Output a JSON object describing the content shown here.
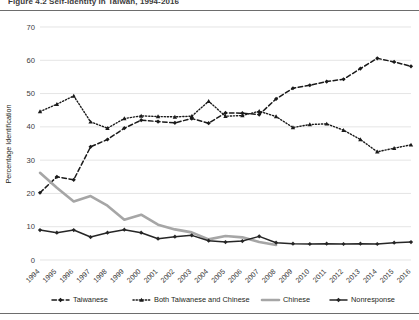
{
  "figure": {
    "title": "Figure 4.2   Self-identity in Taiwan, 1994-2016",
    "title_clipped": true
  },
  "chart_data": {
    "type": "line",
    "title": "Figure 4.2   Self-identity in Taiwan, 1994-2016",
    "xlabel": "",
    "ylabel": "Percentage Identification",
    "ylim": [
      0,
      70
    ],
    "ytick_step": 10,
    "yticks": [
      0,
      10,
      20,
      30,
      40,
      50,
      60,
      70
    ],
    "grid": true,
    "legend_position": "bottom",
    "categories": [
      "1994",
      "1995",
      "1996",
      "1997",
      "1998",
      "1999",
      "2000",
      "2001",
      "2002",
      "2003",
      "2004",
      "2005",
      "2006",
      "2007",
      "2008",
      "2009",
      "2010",
      "2011",
      "2012",
      "2013",
      "2014",
      "2015",
      "2016"
    ],
    "series": [
      {
        "name": "Taiwanese",
        "style": "dashed",
        "color": "#1a1a1a",
        "marker": "diamond",
        "values": [
          20.2,
          25.0,
          24.1,
          34.0,
          36.2,
          39.6,
          42.0,
          41.6,
          41.2,
          42.5,
          41.1,
          44.2,
          44.1,
          43.7,
          48.4,
          51.6,
          52.5,
          53.6,
          54.3,
          57.5,
          60.6,
          59.5,
          58.2
        ]
      },
      {
        "name": "Both Taiwanese and Chinese",
        "style": "dotted",
        "color": "#1a1a1a",
        "marker": "triangle",
        "values": [
          44.6,
          46.8,
          49.3,
          41.5,
          39.6,
          42.5,
          43.3,
          43.1,
          43.0,
          43.2,
          47.7,
          43.2,
          43.4,
          44.7,
          43.1,
          39.8,
          40.7,
          40.9,
          39.0,
          36.2,
          32.5,
          33.6,
          34.6
        ]
      },
      {
        "name": "Chinese",
        "style": "solid-thick",
        "color": "#a6a6a6",
        "marker": "none",
        "values": [
          26.2,
          21.7,
          17.6,
          19.2,
          16.3,
          12.1,
          13.6,
          10.6,
          9.2,
          8.3,
          6.2,
          7.2,
          6.8,
          5.4,
          4.5,
          null,
          null,
          null,
          null,
          null,
          null,
          null,
          null
        ]
      },
      {
        "name": "Nonresponse",
        "style": "solid",
        "color": "#262626",
        "marker": "diamond",
        "values": [
          9.0,
          8.2,
          9.0,
          6.9,
          8.2,
          9.1,
          8.2,
          6.4,
          7.0,
          7.4,
          5.8,
          5.4,
          5.7,
          7.1,
          5.2,
          4.9,
          4.8,
          4.9,
          4.8,
          4.9,
          4.8,
          5.2,
          5.4
        ]
      }
    ]
  },
  "legend": {
    "items": [
      {
        "label": "Taiwanese",
        "key": "taiwanese"
      },
      {
        "label": "Both Taiwanese and Chinese",
        "key": "both-taiwanese-and-chinese"
      },
      {
        "label": "Chinese",
        "key": "chinese"
      },
      {
        "label": "Nonresponse",
        "key": "nonresponse"
      }
    ]
  },
  "axes": {
    "y_title": "Percentage Identification",
    "y_labels": [
      "70",
      "60",
      "50",
      "40",
      "30",
      "20",
      "10",
      "0"
    ],
    "x_labels": [
      "1994",
      "1995",
      "1996",
      "1997",
      "1998",
      "1999",
      "2000",
      "2001",
      "2002",
      "2003",
      "2004",
      "2005",
      "2006",
      "2007",
      "2008",
      "2009",
      "2010",
      "2011",
      "2012",
      "2013",
      "2014",
      "2015",
      "2016"
    ]
  }
}
